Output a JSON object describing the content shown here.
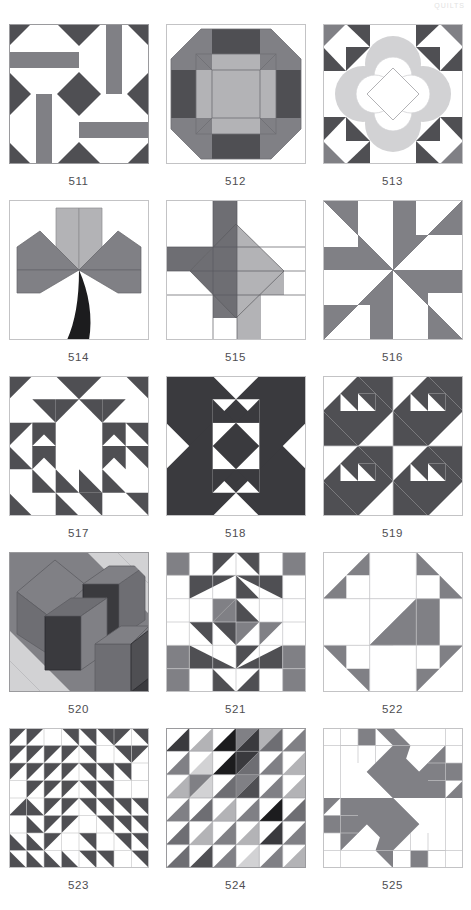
{
  "page": {
    "running_head": "QUILTS",
    "background_color": "#ffffff",
    "caption_color": "#4e4e52",
    "columns": 3,
    "rows": 5,
    "block_size_px": 140
  },
  "palette": {
    "white": "#ffffff",
    "dark_gray": "#4f4f53",
    "charcoal": "#3a3a3e",
    "near_black": "#1c1c1e",
    "medium_gray": "#808085",
    "mid_gray": "#6e6e73",
    "light_gray": "#b3b3b6",
    "pale_gray": "#d2d2d4",
    "very_pale": "#e3e3e4",
    "outline": "#9a9a9d"
  },
  "blocks": [
    {
      "id": "511",
      "label": "511",
      "name": "four-patch-spool-block",
      "description": "Four-patch of spool units with dark corner triangles, white octagon grounds and medium gray bars",
      "colors": [
        "#ffffff",
        "#4f4f53",
        "#808085"
      ]
    },
    {
      "id": "512",
      "label": "512",
      "name": "octagon-snowball-block",
      "description": "Concentric octagon with dark edge bars, medium gray corner triangles and light gray inner frame with center square",
      "colors": [
        "#ffffff",
        "#4f4f53",
        "#808085",
        "#b3b3b6"
      ]
    },
    {
      "id": "513",
      "label": "513",
      "name": "applique-flower-diamond-block",
      "description": "Pale gray four-lobe applique flower with white scalloped center and outlined diamond, dark corner and edge triangles",
      "colors": [
        "#ffffff",
        "#4f4f53",
        "#d2d2d4",
        "#808085"
      ]
    },
    {
      "id": "514",
      "label": "514",
      "name": "lily-stem-block",
      "description": "Six-point lily of light and medium gray diamonds with a curved black stem",
      "colors": [
        "#ffffff",
        "#b3b3b6",
        "#808085",
        "#1c1c1e"
      ]
    },
    {
      "id": "515",
      "label": "515",
      "name": "tilted-square-cross-block",
      "description": "Tilted dark and light gray square on point with medium gray cross arms reaching the edges",
      "colors": [
        "#ffffff",
        "#6e6e73",
        "#808085",
        "#b3b3b6"
      ]
    },
    {
      "id": "516",
      "label": "516",
      "name": "pinwheel-whirl-block",
      "description": "Four-blade whirling pinwheel of medium gray wedges on white",
      "colors": [
        "#ffffff",
        "#808085"
      ]
    },
    {
      "id": "517",
      "label": "517",
      "name": "double-x-chain-block",
      "description": "Six by six grid of dark gray half-square triangles forming a linked double-X chain",
      "colors": [
        "#ffffff",
        "#4f4f53"
      ]
    },
    {
      "id": "518",
      "label": "518",
      "name": "big-x-block",
      "description": "Bold dark X across a six by six grid with white squares in the quadrants",
      "colors": [
        "#ffffff",
        "#3a3a3e"
      ]
    },
    {
      "id": "519",
      "label": "519",
      "name": "four-unit-arrow-repeat-block",
      "description": "Two by two repeat of a dark arrowhead unit on white",
      "colors": [
        "#ffffff",
        "#4f4f53"
      ]
    },
    {
      "id": "520",
      "label": "520",
      "name": "tumbling-blocks-cube-block",
      "description": "Three dimensional tumbling blocks cubes in light, medium and dark gray",
      "colors": [
        "#d2d2d4",
        "#808085",
        "#6e6e73",
        "#3a3a3e",
        "#b3b3b6"
      ]
    },
    {
      "id": "521",
      "label": "521",
      "name": "pinwheel-star-grid-block",
      "description": "Six by six grid combining dark and medium gray triangles into a central pinwheel with corner stars",
      "colors": [
        "#ffffff",
        "#4f4f53",
        "#808085"
      ]
    },
    {
      "id": "522",
      "label": "522",
      "name": "diagonal-bar-corner-block",
      "description": "Medium gray diagonal center bar with gray corner triangle units on white",
      "colors": [
        "#ffffff",
        "#808085"
      ]
    },
    {
      "id": "523",
      "label": "523",
      "name": "half-square-triangle-field-block",
      "description": "Eight by eight field of dark gray half-square triangles radiating from the center",
      "colors": [
        "#ffffff",
        "#4f4f53"
      ]
    },
    {
      "id": "524",
      "label": "524",
      "name": "scrappy-triangle-grid-block",
      "description": "Six by six grid of half-square triangles in assorted gray values",
      "colors": [
        "#ffffff",
        "#1c1c1e",
        "#3a3a3e",
        "#6e6e73",
        "#808085",
        "#b3b3b6",
        "#d2d2d4"
      ]
    },
    {
      "id": "525",
      "label": "525",
      "name": "dutchmans-puzzle-pinwheel-block",
      "description": "Large four-blade gray pinwheel with stepped sawtooth edges on white",
      "colors": [
        "#ffffff",
        "#808085"
      ]
    }
  ]
}
